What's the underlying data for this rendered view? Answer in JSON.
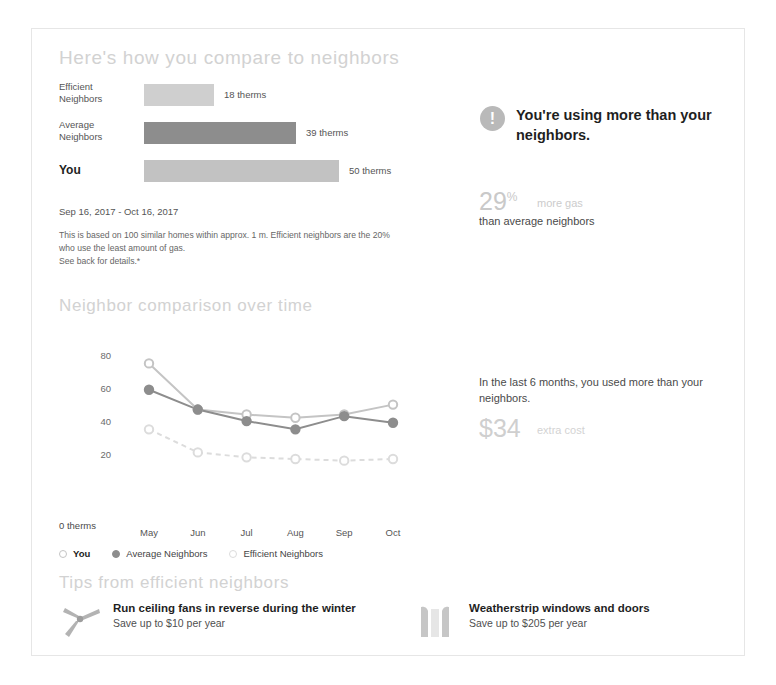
{
  "compare": {
    "title": "Here's how you compare to neighbors",
    "unit": "therms",
    "bars": [
      {
        "label_line1": "Efficient",
        "label_line2": "Neighbors",
        "value": 18,
        "value_text": "18 therms",
        "color": "#cfcfcf"
      },
      {
        "label_line1": "Average",
        "label_line2": "Neighbors",
        "value": 39,
        "value_text": "39 therms",
        "color": "#8d8d8d"
      },
      {
        "label_line1": "You",
        "label_line2": "",
        "value": 50,
        "value_text": "50 therms",
        "color": "#c2c2c2"
      }
    ],
    "date_range": "Sep 16, 2017 - Oct 16, 2017",
    "disclaimer": "This is based on 100 similar homes within approx. 1 m. Efficient neighbors are the 20% who use the least amount of gas.",
    "disclaimer_line2": "See back for details.*"
  },
  "callout": {
    "icon": "exclamation-circle-icon",
    "headline": "You're using more than your neighbors.",
    "stat_value": "29",
    "stat_suffix": "%",
    "stat_label": "more gas",
    "stat_sub": "than average neighbors"
  },
  "overtime": {
    "title": "Neighbor comparison over time",
    "note": "In the last 6 months, you used more than your neighbors.",
    "cost_value": "$34",
    "cost_label": "extra cost"
  },
  "chart_data": {
    "type": "line",
    "title": "Neighbor comparison over time",
    "xlabel": "",
    "ylabel": "therms",
    "categories": [
      "May",
      "Jun",
      "Jul",
      "Aug",
      "Sep",
      "Oct"
    ],
    "yticks": [
      20,
      40,
      60,
      80
    ],
    "ytick_labels": [
      "20",
      "40",
      "60",
      "80"
    ],
    "zero_label": "0 therms",
    "ylim": [
      0,
      88
    ],
    "grid": false,
    "legend_position": "bottom",
    "series": [
      {
        "name": "You",
        "values": [
          75,
          47,
          44,
          42,
          44,
          50
        ],
        "color": "#c4c4c4",
        "marker": "open",
        "style": "solid"
      },
      {
        "name": "Average Neighbors",
        "values": [
          59,
          47,
          40,
          35,
          43,
          39
        ],
        "color": "#8d8d8d",
        "marker": "filled",
        "style": "solid"
      },
      {
        "name": "Efficient Neighbors",
        "values": [
          35,
          21,
          18,
          17,
          16,
          17
        ],
        "color": "#dcdcdc",
        "marker": "open",
        "style": "dashed"
      }
    ]
  },
  "tips": {
    "title": "Tips from efficient neighbors",
    "items": [
      {
        "icon": "ceiling-fan-icon",
        "title": "Run ceiling fans in reverse during the winter",
        "sub": "Save up to $10 per year"
      },
      {
        "icon": "window-icon",
        "title": "Weatherstrip windows and doors",
        "sub": "Save up to $205 per year"
      }
    ]
  }
}
